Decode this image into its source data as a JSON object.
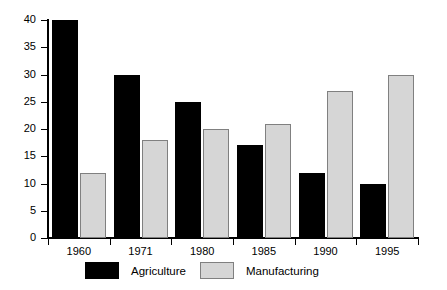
{
  "chart_data": {
    "type": "bar",
    "title": "",
    "subtitle": "",
    "xlabel": "",
    "ylabel": "",
    "categories": [
      "1960",
      "1971",
      "1980",
      "1985",
      "1990",
      "1995"
    ],
    "series": [
      {
        "name": "Agriculture",
        "color": "#000000",
        "values": [
          40,
          30,
          25,
          17,
          12,
          10
        ]
      },
      {
        "name": "Manufacturing",
        "color": "#d6d6d6",
        "values": [
          12,
          18,
          20,
          21,
          27,
          30
        ]
      }
    ],
    "ylim": [
      0,
      40
    ],
    "ytick_step": 5,
    "yticks": [
      "0",
      "5",
      "10",
      "15",
      "20",
      "25",
      "30",
      "35",
      "40"
    ],
    "grid": false,
    "legend_position": "bottom"
  },
  "legend": {
    "entries": [
      {
        "label": "Agriculture"
      },
      {
        "label": "Manufacturing"
      }
    ]
  }
}
